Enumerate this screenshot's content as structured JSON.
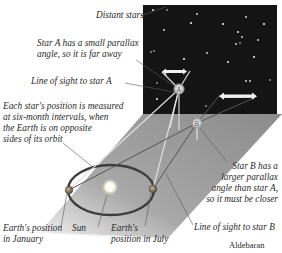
{
  "diagram": {
    "type": "stellar-parallax",
    "labels": {
      "distant_stars": "Distant stars",
      "star_a_small_parallax": [
        "Star A has a small parallax",
        "angle, so it is far away"
      ],
      "line_of_sight_a": "Line of sight to star A",
      "six_month": [
        "Each star's position is measured",
        "at six-month intervals, when",
        "the Earth is on opposite",
        "sides of its orbit"
      ],
      "star_b_larger_parallax": [
        "Star B has a",
        "larger parallax",
        "angle than star A,",
        "so it must be closer"
      ],
      "line_of_sight_b": "Line of sight to star B",
      "earth_january": [
        "Earth's position",
        "in January"
      ],
      "sun": "Sun",
      "earth_july": [
        "Earth's",
        "position in July"
      ],
      "caption": "Aldebaran"
    },
    "markers": {
      "star_a": "A",
      "star_b": "B"
    },
    "colors": {
      "sky": "#141414",
      "plane": "#9a9a9a",
      "orbit": "#3e3e3e",
      "star": "#e8e8e8",
      "sun": "#fdfde8",
      "earth": "#7a6a55",
      "sight_line_light": "#e2e2e2",
      "sight_line_dark": "#555555",
      "leader": "#555555"
    }
  }
}
